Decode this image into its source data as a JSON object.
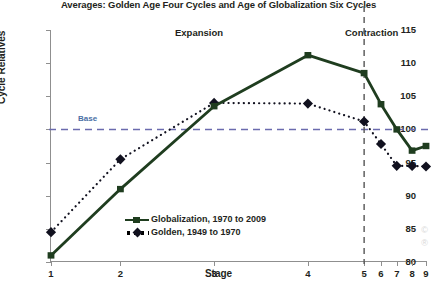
{
  "chart_data": {
    "type": "line",
    "title": "Averages: Golden Age Four Cycles and Age of Globalization Six Cycles",
    "xlabel": "Stage",
    "ylabel": "Cycle Relatives",
    "categories": [
      "1",
      "2",
      "3",
      "4",
      "5",
      "6",
      "7",
      "8",
      "9"
    ],
    "x_tick_positions_pct": [
      0,
      18.5,
      43.5,
      68.5,
      83.5,
      88.0,
      92.2,
      96.3,
      100.0
    ],
    "ylim": [
      80,
      115
    ],
    "yticks": [
      80,
      85,
      90,
      95,
      100,
      105,
      110,
      115
    ],
    "grid": false,
    "legend_position": "inside-lower-center",
    "series": [
      {
        "name": "Globalization, 1970 to 2009",
        "marker": "square",
        "line_style": "solid",
        "color": "#1f3d1f",
        "values": [
          81.0,
          91.0,
          103.5,
          111.2,
          108.5,
          103.8,
          100.0,
          96.8,
          97.5
        ]
      },
      {
        "name": "Golden, 1949 to 1970",
        "marker": "diamond",
        "line_style": "dotted",
        "color": "#11111f",
        "values": [
          84.5,
          95.5,
          104.0,
          103.9,
          101.2,
          97.8,
          94.5,
          94.5,
          94.4
        ]
      }
    ],
    "annotations": [
      {
        "name": "expansion-label",
        "text": "Expansion"
      },
      {
        "name": "contraction-label",
        "text": "Contraction"
      },
      {
        "name": "base-line-label",
        "text": "Base",
        "value": 100
      },
      {
        "name": "phase-divider",
        "at_stage": "5"
      }
    ],
    "reference_lines": [
      {
        "name": "base-line",
        "orientation": "horizontal",
        "value": 100,
        "style": "dashed",
        "color": "#6b6bae"
      },
      {
        "name": "phase-divider-line",
        "orientation": "vertical",
        "at_stage": "5",
        "style": "dashed",
        "color": "#555555"
      }
    ]
  },
  "colors": {
    "globalization": "#1f3d1f",
    "golden": "#11111f",
    "base_line": "#6b6bae",
    "divider": "#555555",
    "axis": "#8f8f8f",
    "text": "#231f20"
  },
  "watermark": {
    "line1": "©",
    "line2": "®"
  }
}
